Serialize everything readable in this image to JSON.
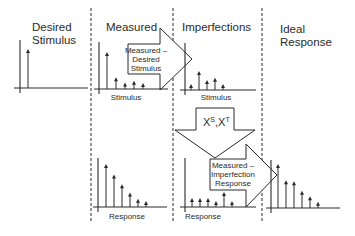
{
  "columns": [
    {
      "title_line1": "Desired",
      "title_line2": "Stimulus"
    },
    {
      "title_line1": "Measured",
      "title_line2": ""
    },
    {
      "title_line1": "Imperfections",
      "title_line2": ""
    },
    {
      "title_line1": "Ideal",
      "title_line2": "Response"
    }
  ],
  "plot_labels": {
    "measured_stimulus": "Stimulus",
    "imperfection_stimulus": "Stimulus",
    "measured_response": "Response",
    "imperfection_response": "Response"
  },
  "arrows": {
    "subtract_stimulus": {
      "line1": "Measured –",
      "line2": "Desired",
      "line3": "Stimulus"
    },
    "transform": {
      "label": "X",
      "sup1": "S",
      "sep": ",X",
      "sup2": "T"
    },
    "subtract_response": {
      "line1": "Measured –",
      "line2": "Imperfection",
      "line3": "Response"
    }
  },
  "signals": {
    "desired_stimulus": [
      0.0,
      1.0
    ],
    "measured_stimulus": [
      1.0,
      0.3,
      0.15,
      0.2,
      0.1
    ],
    "imperfection_stimulus": [
      0.1,
      0.4,
      0.2,
      0.25,
      0.1
    ],
    "measured_response": [
      1.0,
      0.75,
      0.52,
      0.32,
      0.17,
      0.08
    ],
    "imperfection_response": [
      0.2,
      0.2,
      0.2,
      0.08,
      0.35,
      0.08
    ],
    "ideal_response": [
      1.0,
      0.62,
      0.6,
      0.38,
      0.25,
      0.12
    ]
  }
}
